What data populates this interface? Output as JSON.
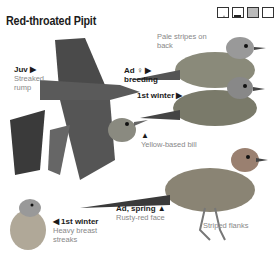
{
  "title": "Red-throated Pipit",
  "habitat_icons": [
    "woodland-icon",
    "wetland-icon",
    "grassland-icon",
    "open-ground-icon"
  ],
  "labels": {
    "juv": {
      "age": "Juv",
      "arrow": "▶",
      "note1": "Streaked",
      "note2": "rump"
    },
    "pale_stripes": {
      "line1": "Pale stripes on",
      "line2": "back"
    },
    "ad_female": {
      "age": "Ad ♀",
      "arrow": "▶",
      "line2": "breeding"
    },
    "first_winter_right": {
      "age": "1st winter",
      "arrow": "▶"
    },
    "yellow_bill": {
      "arrow": "▲",
      "note": "Yellow-based bill"
    },
    "first_winter_left": {
      "arrow": "◀",
      "age": "1st winter",
      "note1": "Heavy breast",
      "note2": "streaks"
    },
    "ad_spring": {
      "age": "Ad, spring",
      "arrow": "▲",
      "note": "Rusty-red face"
    },
    "striped_flanks": {
      "note": "Striped flanks"
    }
  }
}
